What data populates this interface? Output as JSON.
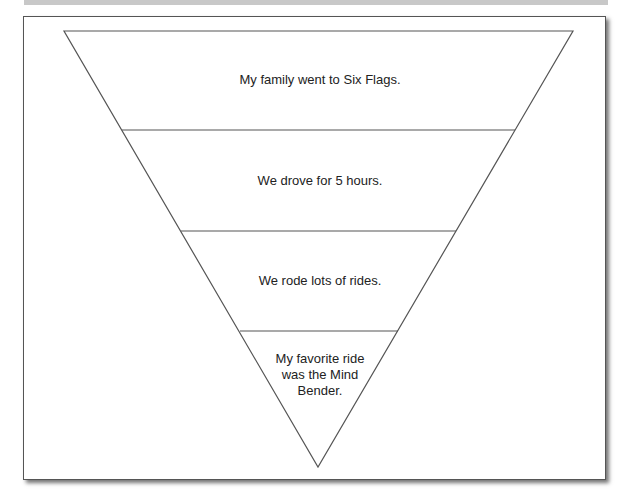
{
  "diagram": {
    "type": "inverted-pyramid",
    "levels": [
      {
        "text": "My family went to Six Flags."
      },
      {
        "text": "We drove for 5 hours."
      },
      {
        "text": "We rode lots of rides."
      },
      {
        "text": "My favorite ride was the Mind Bender."
      }
    ],
    "colors": {
      "stroke": "#555555",
      "text": "#222222",
      "background": "#ffffff"
    }
  }
}
